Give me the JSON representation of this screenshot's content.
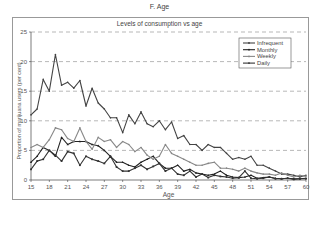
{
  "figure": {
    "caption": "F. Age"
  },
  "chart_data": {
    "type": "line",
    "title": "Levels of consumption vs age",
    "xlabel": "Age",
    "ylabel": "Proportion of marijuana users (per cent)",
    "xlim": [
      15,
      60
    ],
    "ylim": [
      0,
      25
    ],
    "xticks": [
      15,
      18,
      21,
      24,
      27,
      30,
      33,
      36,
      39,
      42,
      45,
      48,
      51,
      54,
      57,
      60
    ],
    "yticks": [
      0,
      5,
      10,
      15,
      20,
      25
    ],
    "grid": "horizontal dashed",
    "legend_position": "upper right",
    "x": [
      15,
      16,
      17,
      18,
      19,
      20,
      21,
      22,
      23,
      24,
      25,
      26,
      27,
      28,
      29,
      30,
      31,
      32,
      33,
      34,
      35,
      36,
      37,
      38,
      39,
      40,
      41,
      42,
      43,
      44,
      45,
      46,
      47,
      48,
      49,
      50,
      51,
      52,
      53,
      54,
      55,
      56,
      57,
      58,
      59,
      60
    ],
    "series": [
      {
        "name": "Infrequent",
        "color": "#444444",
        "marker": "dot",
        "values": [
          11,
          12,
          17,
          15,
          21.2,
          16,
          16.5,
          15.5,
          16.8,
          12.5,
          15.5,
          13,
          12,
          10.5,
          10.5,
          8,
          11,
          9.5,
          11.5,
          9.5,
          9,
          10,
          8.5,
          9.8,
          7,
          7.5,
          6,
          6,
          5,
          6,
          5.5,
          5.5,
          4.5,
          3.5,
          3.8,
          3.5,
          4,
          2.5,
          2.5,
          2,
          1.5,
          1,
          1,
          0.8,
          0.5,
          0.8
        ]
      },
      {
        "name": "Monthly",
        "color": "#222222",
        "marker": "triangle",
        "values": [
          3,
          4,
          5.5,
          5,
          4,
          7.2,
          6,
          6.5,
          6.5,
          6.5,
          6,
          5.8,
          5,
          4,
          3,
          3,
          2.5,
          2.2,
          3,
          3.5,
          4,
          2.8,
          2,
          2,
          2.5,
          1.5,
          1.8,
          1.2,
          1,
          0.8,
          1,
          1.5,
          0.8,
          0.5,
          0.4,
          0.5,
          0.8,
          0.3,
          0.4,
          0.5,
          0.3,
          0.2,
          0.3,
          0.2,
          0.2,
          0.3
        ]
      },
      {
        "name": "Weekly",
        "color": "#888888",
        "marker": "dot",
        "values": [
          5.5,
          6,
          5.5,
          6.8,
          8.8,
          8.5,
          7,
          6.5,
          8.8,
          6.5,
          5.2,
          7.2,
          6.5,
          6.8,
          5.5,
          6.5,
          6,
          4.8,
          5.5,
          4.2,
          3.5,
          4,
          6,
          4.5,
          4,
          3.5,
          3,
          2.5,
          2.5,
          2.8,
          3,
          2,
          2,
          1.8,
          1.5,
          2,
          1.5,
          1.2,
          1,
          1,
          0.8,
          1.2,
          0.8,
          0.5,
          0.8,
          0.6
        ]
      },
      {
        "name": "Daily",
        "color": "#333333",
        "marker": "square",
        "values": [
          1.8,
          3.2,
          3.5,
          5,
          4.2,
          3.2,
          4.8,
          4.5,
          2.5,
          4,
          3.5,
          3.2,
          2.8,
          4,
          2.2,
          1.5,
          1.5,
          2,
          2.5,
          1.8,
          2.3,
          2.8,
          1.5,
          2,
          1,
          0.8,
          1.5,
          0.5,
          1,
          0.4,
          0.8,
          0.6,
          0.5,
          0.3,
          0.4,
          1.5,
          0.3,
          0.2,
          0.3,
          0.5,
          0.2,
          0.2,
          0.3,
          0.1,
          0.2,
          0.2
        ]
      }
    ]
  }
}
